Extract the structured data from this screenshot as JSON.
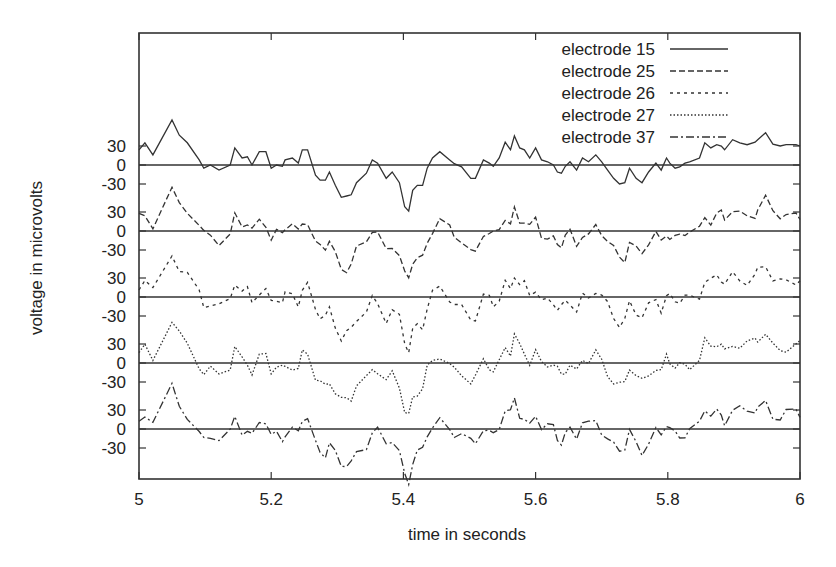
{
  "chart_data": {
    "type": "line",
    "title": "",
    "xlabel": "time in seconds",
    "ylabel": "voltage in microvolts",
    "xlim": [
      5,
      6
    ],
    "x_ticks": [
      "5",
      "5.2",
      "5.4",
      "5.6",
      "5.8",
      "6"
    ],
    "y_ticks_per_trace": [
      "30",
      "0",
      "-30"
    ],
    "y_offset_layout": "stacked traces, each with own 0 baseline, tick spacing 30 µV",
    "grid": false,
    "legend_position": "top-right inside",
    "series": [
      {
        "name": "electrode 15",
        "line_style": "solid",
        "t": [
          5.0,
          5.009,
          5.021,
          5.05,
          5.061,
          5.073,
          5.091,
          5.098,
          5.108,
          5.121,
          5.138,
          5.145,
          5.156,
          5.164,
          5.171,
          5.182,
          5.192,
          5.2,
          5.208,
          5.217,
          5.221,
          5.232,
          5.241,
          5.247,
          5.255,
          5.267,
          5.274,
          5.282,
          5.288,
          5.297,
          5.306,
          5.314,
          5.321,
          5.329,
          5.344,
          5.353,
          5.361,
          5.374,
          5.383,
          5.394,
          5.402,
          5.408,
          5.414,
          5.421,
          5.429,
          5.436,
          5.444,
          5.455,
          5.47,
          5.477,
          5.488,
          5.502,
          5.509,
          5.521,
          5.53,
          5.536,
          5.545,
          5.554,
          5.562,
          5.568,
          5.576,
          5.583,
          5.591,
          5.6,
          5.609,
          5.618,
          5.627,
          5.633,
          5.639,
          5.645,
          5.652,
          5.662,
          5.671,
          5.68,
          5.691,
          5.7,
          5.709,
          5.718,
          5.727,
          5.735,
          5.742,
          5.752,
          5.761,
          5.771,
          5.782,
          5.79,
          5.798,
          5.803,
          5.811,
          5.818,
          5.826,
          5.833,
          5.848,
          5.856,
          5.865,
          5.874,
          5.881,
          5.886,
          5.898,
          5.909,
          5.92,
          5.932,
          5.936,
          5.948,
          5.959,
          5.97,
          5.979,
          5.994,
          6.0
        ],
        "values": [
          24,
          35,
          16,
          71,
          47,
          35,
          8,
          -5,
          0,
          -8,
          0,
          27,
          11,
          13,
          0,
          21,
          21,
          -5,
          0,
          -2,
          8,
          11,
          3,
          24,
          24,
          -16,
          -24,
          -24,
          -11,
          -32,
          -51,
          -49,
          -47,
          -28,
          -13,
          8,
          3,
          -21,
          -11,
          -28,
          -66,
          -73,
          -40,
          -32,
          -32,
          -5,
          11,
          21,
          8,
          2,
          -3,
          -21,
          -21,
          8,
          3,
          -2,
          11,
          36,
          24,
          46,
          27,
          24,
          11,
          27,
          8,
          5,
          0,
          -11,
          -13,
          -2,
          5,
          -8,
          11,
          5,
          16,
          5,
          -8,
          -21,
          -30,
          -28,
          -5,
          -21,
          -28,
          -11,
          3,
          -8,
          11,
          3,
          -5,
          -3,
          3,
          5,
          11,
          35,
          27,
          32,
          30,
          24,
          40,
          35,
          32,
          36,
          40,
          51,
          33,
          30,
          32,
          32,
          30
        ]
      },
      {
        "name": "electrode 25",
        "line_style": "dashed"
      },
      {
        "name": "electrode 26",
        "line_style": "dotted-dashed-short"
      },
      {
        "name": "electrode 27",
        "line_style": "dotted"
      },
      {
        "name": "electrode 37",
        "line_style": "dash-dot"
      }
    ]
  },
  "legend": {
    "items": [
      {
        "label": "electrode 15"
      },
      {
        "label": "electrode 25"
      },
      {
        "label": "electrode 26"
      },
      {
        "label": "electrode 27"
      },
      {
        "label": "electrode 37"
      }
    ]
  },
  "axes": {
    "xlabel": "time in seconds",
    "ylabel": "voltage in microvolts",
    "x_ticks": [
      "5",
      "5.2",
      "5.4",
      "5.6",
      "5.8",
      "6"
    ],
    "y_tick_30": "30",
    "y_tick_0": "0",
    "y_tick_m30": "-30"
  }
}
